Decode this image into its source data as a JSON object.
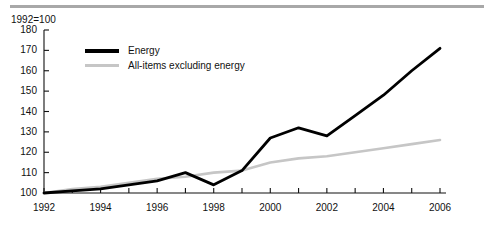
{
  "figure": {
    "note": "1992=100",
    "rule_color": "#a8a8a8"
  },
  "legend": {
    "position": "top-left-inside",
    "entries": [
      {
        "label": "Energy",
        "color": "#000000",
        "width": 4
      },
      {
        "label": "All-items excluding energy",
        "color": "#c6c6c6",
        "width": 3
      }
    ]
  },
  "chart_data": {
    "type": "line",
    "title": "1992=100",
    "xlabel": "",
    "ylabel": "",
    "xlim": [
      1992,
      2006
    ],
    "ylim": [
      100,
      180
    ],
    "yticks": [
      100,
      110,
      120,
      130,
      140,
      150,
      160,
      170,
      180
    ],
    "xticks": [
      1992,
      1993,
      1994,
      1995,
      1996,
      1997,
      1998,
      1999,
      2000,
      2001,
      2002,
      2003,
      2004,
      2005,
      2006
    ],
    "xtick_labels_shown": [
      1992,
      1994,
      1996,
      1998,
      2000,
      2002,
      2004,
      2006
    ],
    "grid": false,
    "x": [
      1992,
      1993,
      1994,
      1995,
      1996,
      1997,
      1998,
      1999,
      2000,
      2001,
      2002,
      2003,
      2004,
      2005,
      2006
    ],
    "series": [
      {
        "name": "Energy",
        "color": "#000000",
        "values": [
          100,
          101,
          102,
          104,
          106,
          110,
          104,
          111,
          127,
          132,
          128,
          138,
          148,
          160,
          171
        ]
      },
      {
        "name": "All-items excluding energy",
        "color": "#c6c6c6",
        "values": [
          100,
          102,
          103,
          105,
          107,
          108,
          110,
          111,
          115,
          117,
          118,
          120,
          122,
          124,
          126
        ]
      }
    ]
  }
}
